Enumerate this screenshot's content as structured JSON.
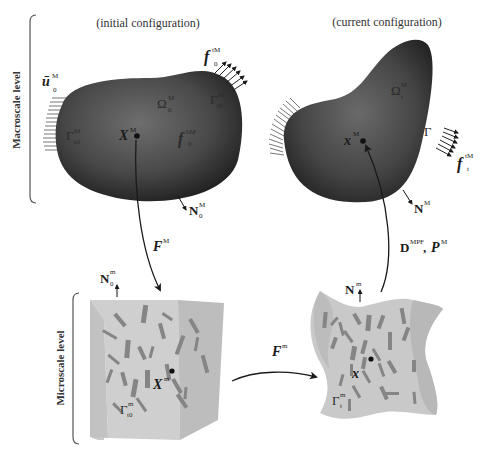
{
  "captions": {
    "initial": "(initial configuration)",
    "current": "(current configuration)"
  },
  "levels": {
    "macro": "Macroscale level",
    "micro": "Microscale level"
  },
  "macro_initial": {
    "displacement": {
      "base": "ū",
      "sup": "M",
      "sub": "0"
    },
    "traction": {
      "base": "f",
      "sup": "tM",
      "sub": "0"
    },
    "domain": {
      "base": "Ω",
      "sup": "M",
      "sub": "0"
    },
    "boundary_u": {
      "base": "Γ",
      "sup": "M",
      "sub": "u0"
    },
    "boundary_t": {
      "base": "Γ",
      "sup": "M",
      "sub": "t0"
    },
    "point": {
      "base": "X",
      "sup": "M"
    },
    "body_force": {
      "base": "f",
      "sup": "bM",
      "sub": "0"
    },
    "normal": {
      "base": "N",
      "sup": "M",
      "sub": "0"
    }
  },
  "macro_current": {
    "domain": {
      "base": "Ω",
      "sup": "M",
      "sub": "t"
    },
    "point": {
      "base": "x",
      "sup": "M"
    },
    "boundary_t": {
      "base": "Γ"
    },
    "traction": {
      "base": "f",
      "sup": "tM",
      "sub": "t"
    },
    "normal": {
      "base": "N",
      "sup": "M"
    }
  },
  "micro_initial": {
    "normal": {
      "base": "N",
      "sup": "m",
      "sub": "0"
    },
    "point": {
      "base": "X",
      "sup": "m"
    },
    "boundary": {
      "base": "Γ",
      "sup": "m",
      "sub": "t0"
    }
  },
  "micro_current": {
    "normal": {
      "base": "N",
      "sup": "m"
    },
    "point": {
      "base": "x"
    },
    "boundary": {
      "base": "Γ",
      "sup": "m",
      "sub": "t"
    }
  },
  "arrows": {
    "macro_to_micro": {
      "base": "F",
      "sup": "M"
    },
    "micro_deform": {
      "base": "F",
      "sup": "m"
    },
    "micro_to_macro": {
      "d": "D",
      "d_sup": "MPF",
      "sep": ", ",
      "p": "P",
      "p_sup": "M"
    }
  },
  "colors": {
    "body_dark": "#2e2e2e",
    "body_light": "#6a6a6a",
    "micro_fill": "#c8c8c8",
    "micro_side": "#b4b4b4",
    "fiber": "#7a7a7a",
    "ink": "#1a1a1a"
  }
}
